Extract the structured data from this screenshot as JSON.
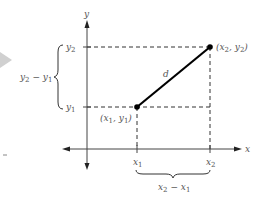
{
  "diagram": {
    "axes": {
      "x_label": "x",
      "y_label": "y"
    },
    "points": [
      {
        "id": "p1",
        "label": "(x",
        "sub_x": "1",
        "mid": ", y",
        "sub_y": "1",
        "close": ")",
        "full": "(x1, y1)"
      },
      {
        "id": "p2",
        "label": "(x",
        "sub_x": "2",
        "mid": ", y",
        "sub_y": "2",
        "close": ")",
        "full": "(x2, y2)"
      }
    ],
    "segment_label": "d",
    "ticks": {
      "x1": {
        "base": "x",
        "sub": "1"
      },
      "x2": {
        "base": "x",
        "sub": "2"
      },
      "y1": {
        "base": "y",
        "sub": "1"
      },
      "y2": {
        "base": "y",
        "sub": "2"
      }
    },
    "braces": {
      "vertical": {
        "text": "y2 − y1",
        "base1": "y",
        "sub1": "2",
        "op": " − ",
        "base2": "y",
        "sub2": "1"
      },
      "horizontal": {
        "text": "x2 − x1",
        "base1": "x",
        "sub1": "2",
        "op": " − ",
        "base2": "x",
        "sub2": "1"
      }
    },
    "colors": {
      "axis": "#444444",
      "segment": "#000000",
      "dashed": "#333333",
      "text": "#555555",
      "triangle": "#cccccc"
    }
  }
}
